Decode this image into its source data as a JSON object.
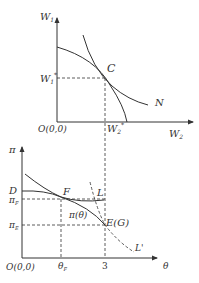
{
  "top_panel": {
    "y_axis_label": "W",
    "y_axis_sub": "1",
    "x_axis_label": "W",
    "x_axis_sub": "2",
    "origin_label": "O(0,0)",
    "point_label": "C",
    "curve_label": "N",
    "y_tick_label": "W",
    "y_tick_sub": "1",
    "y_tick_sup": "*",
    "x_tick_label": "W",
    "x_tick_sub": "2",
    "x_tick_sup": "*"
  },
  "bottom_panel": {
    "y_axis_label": "π",
    "x_axis_label": "θ",
    "origin_label": "O(0,0)",
    "point_d_label": "D",
    "point_f_label": "F",
    "point_l_label": "L",
    "point_e_label": "E(G)",
    "curve_l_prime_label": "L'",
    "curve_pi_label": "π(θ)",
    "y_tick_f_label": "π",
    "y_tick_f_sub": "F",
    "y_tick_e_label": "π",
    "y_tick_e_sub": "E",
    "x_tick_f_label": "θ",
    "x_tick_f_sub": "F",
    "x_tick_3_label": "3"
  },
  "colors": {
    "line": "#333333",
    "background": "#ffffff"
  }
}
